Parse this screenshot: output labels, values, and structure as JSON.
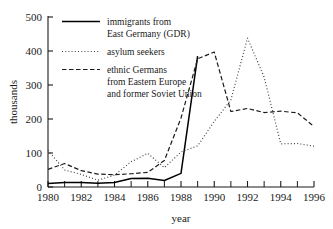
{
  "chart_data": {
    "type": "line",
    "title": "",
    "xlabel": "year",
    "ylabel": "thousands",
    "xlim": [
      1980,
      1996
    ],
    "ylim": [
      0,
      500
    ],
    "grid": false,
    "legend_position": "upper-left",
    "x": [
      1980,
      1981,
      1982,
      1983,
      1984,
      1985,
      1986,
      1987,
      1988,
      1989,
      1990,
      1991,
      1992,
      1993,
      1994,
      1995,
      1996
    ],
    "xticks": [
      1980,
      1982,
      1984,
      1986,
      1988,
      1990,
      1992,
      1994,
      1996
    ],
    "xtick_labels": [
      "1980",
      "1982",
      "1984",
      "1986",
      "1988",
      "1990",
      "1992",
      "1994",
      "1996"
    ],
    "xminor_ticks": [
      1981,
      1983,
      1985,
      1987,
      1989,
      1991,
      1993,
      1995
    ],
    "yticks": [
      0,
      100,
      200,
      300,
      400,
      500
    ],
    "ytick_labels": [
      "0",
      "100",
      "200",
      "300",
      "400",
      "500"
    ],
    "series": [
      {
        "name": "immigrants from East Germany (GDR)",
        "style": "solid",
        "color": "#000000",
        "x": [
          1980,
          1981,
          1982,
          1983,
          1984,
          1985,
          1986,
          1987,
          1988,
          1989
        ],
        "values": [
          10,
          13,
          13,
          11,
          13,
          25,
          26,
          19,
          40,
          385
        ]
      },
      {
        "name": "asylum seekers",
        "style": "dotted",
        "color": "#444444",
        "x": [
          1980,
          1981,
          1982,
          1983,
          1984,
          1985,
          1986,
          1987,
          1988,
          1989,
          1990,
          1991,
          1992,
          1993,
          1994,
          1995,
          1996
        ],
        "values": [
          108,
          50,
          37,
          20,
          35,
          74,
          99,
          57,
          103,
          121,
          193,
          256,
          438,
          323,
          127,
          128,
          120
        ]
      },
      {
        "name": "ethnic Germans from Eastern Europe and former Soviet Union",
        "style": "dashed",
        "color": "#1a1a1a",
        "x": [
          1980,
          1981,
          1982,
          1983,
          1984,
          1985,
          1986,
          1987,
          1988,
          1989,
          1990,
          1991,
          1992,
          1993,
          1994,
          1995,
          1996
        ],
        "values": [
          52,
          69,
          48,
          38,
          36,
          39,
          43,
          78,
          203,
          377,
          397,
          222,
          231,
          219,
          223,
          218,
          178
        ]
      }
    ]
  },
  "legend": {
    "entries": [
      {
        "lines": [
          "immigrants from",
          "East Germany (GDR)"
        ],
        "style": "solid"
      },
      {
        "lines": [
          "asylum seekers"
        ],
        "style": "dotted"
      },
      {
        "lines": [
          "ethnic Germans",
          "from Eastern Europe",
          "and former Soviet Union"
        ],
        "style": "dashed"
      }
    ]
  },
  "axes": {
    "y_title": "thousands",
    "x_title": "year"
  }
}
